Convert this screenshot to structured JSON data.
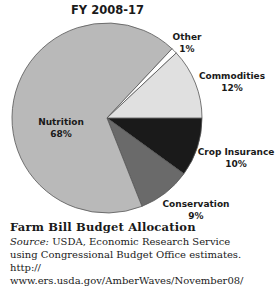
{
  "chart_data": {
    "type": "pie",
    "title": "FY 2008-17",
    "slices": [
      {
        "label": "Crop Insurance",
        "value": 10,
        "display": "10%",
        "color": "#1a1a1a"
      },
      {
        "label": "Conservation",
        "value": 9,
        "display": "9%",
        "color": "#6a6a6a"
      },
      {
        "label": "Nutrition",
        "value": 68,
        "display": "68%",
        "color": "#b9b9b9"
      },
      {
        "label": "Other",
        "value": 1,
        "display": "1%",
        "color": "#ffffff"
      },
      {
        "label": "Commodities",
        "value": 12,
        "display": "12%",
        "color": "#e0e0e0"
      }
    ],
    "start_angle_deg": 0,
    "direction": "clockwise",
    "legend": "none (direct labels)"
  },
  "caption": {
    "title": "Farm Bill Budget Allocation",
    "source_label": "Source:",
    "source_text": " USDA, Economic Research Service",
    "line2": "using Congressional Budget Office estimates. http://",
    "line3": "www.ers.usda.gov/AmberWaves/November08/"
  }
}
